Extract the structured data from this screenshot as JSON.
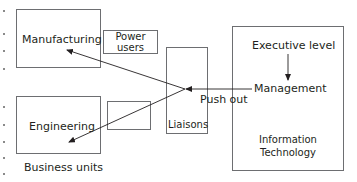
{
  "diagram": {
    "nodes": {
      "manufacturing": {
        "label": "Manufacturing"
      },
      "power_users": {
        "line1": "Power",
        "line2": "users"
      },
      "engineering": {
        "label": "Engineering"
      },
      "unlabeled_box": {
        "label": ""
      },
      "liaisons": {
        "label": "Liaisons"
      },
      "it": {
        "executive": "Executive level",
        "management": "Management",
        "line1": "Information",
        "line2": "Technology"
      }
    },
    "captions": {
      "business_units": "Business units",
      "push_out": "Push out"
    },
    "edges": [
      {
        "from": "Executive level",
        "to": "Management"
      },
      {
        "from": "Management",
        "to": "Liaisons"
      },
      {
        "from": "Liaisons",
        "to": "Manufacturing"
      },
      {
        "from": "Liaisons",
        "to": "Engineering"
      }
    ],
    "colors": {
      "stroke": "#6d6e71",
      "text": "#231f20",
      "arrow": "#231f20"
    }
  }
}
